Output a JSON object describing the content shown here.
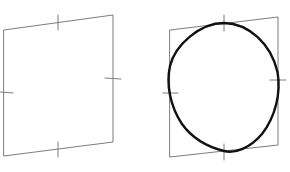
{
  "figure": {
    "background_color": "#ffffff",
    "width": 290,
    "height": 172,
    "quad_stroke_color": "#6e6e70",
    "curve_stroke_color": "#111111",
    "quad_stroke_width": 0.9,
    "curve_stroke_width": 2.4,
    "panels": [
      {
        "name": "left-panel",
        "label": "empty quadrilateral",
        "has_ellipse": false,
        "quad_points": "4,30 113,15 113,142 4,156",
        "corners": {
          "top_left": [
            4,
            30
          ],
          "top_right": [
            113,
            15
          ],
          "bottom_right": [
            113,
            142
          ],
          "bottom_left": [
            4,
            156
          ]
        },
        "ticks": [
          {
            "name": "tick-top",
            "x1": 58,
            "y1": 15,
            "x2": 58,
            "y2": 30
          },
          {
            "name": "tick-right",
            "x1": 105,
            "y1": 78,
            "x2": 121,
            "y2": 79
          },
          {
            "name": "tick-bottom",
            "x1": 58,
            "y1": 142,
            "x2": 58,
            "y2": 157
          },
          {
            "name": "tick-left",
            "x1": 0,
            "y1": 92,
            "x2": 13,
            "y2": 93
          }
        ]
      },
      {
        "name": "right-panel",
        "label": "quadrilateral with inscribed ellipse",
        "has_ellipse": true,
        "quad_points": "170,30 278,17 278,145 170,157",
        "corners": {
          "top_left": [
            170,
            30
          ],
          "top_right": [
            278,
            17
          ],
          "bottom_right": [
            278,
            145
          ],
          "bottom_left": [
            170,
            157
          ]
        },
        "ticks": [
          {
            "name": "tick-top",
            "x1": 224,
            "y1": 15,
            "x2": 224,
            "y2": 31
          },
          {
            "name": "tick-right",
            "x1": 270,
            "y1": 80,
            "x2": 286,
            "y2": 80
          },
          {
            "name": "tick-bottom",
            "x1": 224,
            "y1": 144,
            "x2": 224,
            "y2": 160
          },
          {
            "name": "tick-left",
            "x1": 163,
            "y1": 93,
            "x2": 178,
            "y2": 93
          }
        ],
        "ellipse_tangent_points": [
          {
            "name": "top-tangent",
            "x": 224,
            "y": 23
          },
          {
            "name": "right-tangent",
            "x": 278,
            "y": 80
          },
          {
            "name": "bottom-tangent",
            "x": 224,
            "y": 151
          },
          {
            "name": "left-tangent",
            "x": 170,
            "y": 93
          }
        ],
        "ellipse_path": "M 224 23 C 249 23.5 271 44 277.5 72 C 281 92 276 116 262 134 C 250 148 235 154 224 151 C 208 147 192 138 182 124 C 170 106 166 84 170 66 C 175 45 200 23 224 23 Z"
      }
    ]
  }
}
